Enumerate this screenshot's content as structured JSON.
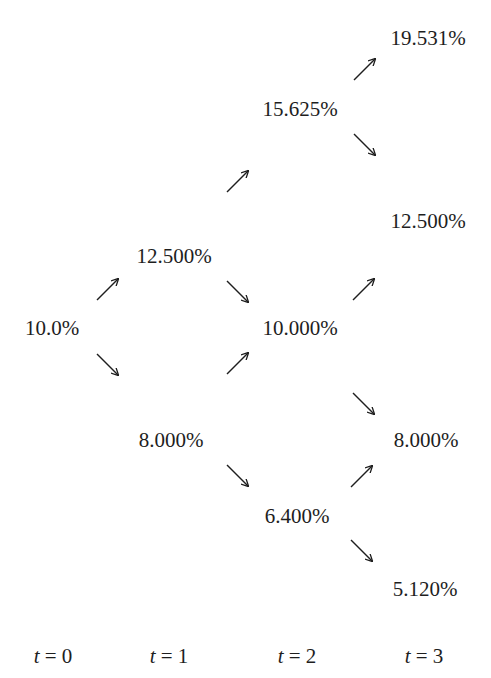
{
  "diagram": {
    "type": "binomial-interest-rate-tree",
    "nodes": {
      "t0": {
        "value": "10.0%"
      },
      "t1_up": {
        "value": "12.500%"
      },
      "t1_down": {
        "value": "8.000%"
      },
      "t2_uu": {
        "value": "15.625%"
      },
      "t2_ud": {
        "value": "10.000%"
      },
      "t2_dd": {
        "value": "6.400%"
      },
      "t3_uuu": {
        "value": "19.531%"
      },
      "t3_uud": {
        "value": "12.500%"
      },
      "t3_udd": {
        "value": "8.000%"
      },
      "t3_ddd": {
        "value": "5.120%"
      }
    },
    "time_labels": [
      {
        "var": "t",
        "eq": " = 0"
      },
      {
        "var": "t",
        "eq": " = 1"
      },
      {
        "var": "t",
        "eq": " = 2"
      },
      {
        "var": "t",
        "eq": " = 3"
      }
    ],
    "arrow_color": "#1e1e1e"
  }
}
